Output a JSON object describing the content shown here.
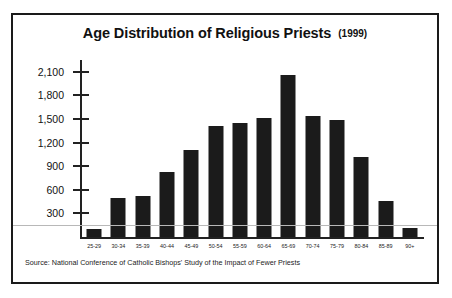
{
  "figure": {
    "title_main": "Age Distribution of Religious Priests",
    "title_year": "(1999)",
    "source": "Source: National Conference of Catholic Bishops' Study of the Impact of Fewer Priests",
    "frame_color": "#1a1a1a",
    "bar_color": "#1b1b1b",
    "background": "#ffffff"
  },
  "chart_data": {
    "type": "bar",
    "xlabel": "",
    "ylabel": "",
    "categories": [
      "25-29",
      "30-34",
      "35-39",
      "40-44",
      "45-49",
      "50-54",
      "55-59",
      "60-64",
      "65-69",
      "70-74",
      "75-79",
      "80-84",
      "85-89",
      "90+"
    ],
    "values": [
      100,
      500,
      520,
      830,
      1105,
      1410,
      1455,
      1510,
      2055,
      1540,
      1485,
      1015,
      455,
      110
    ],
    "ylim": [
      0,
      2250
    ],
    "yticks": [
      300,
      600,
      900,
      1200,
      1500,
      1800,
      2100
    ],
    "ytick_labels": [
      "300",
      "600",
      "900",
      "1,200",
      "1,500",
      "1,800",
      "2,100"
    ],
    "grid": false,
    "legend": null,
    "annotations": [
      "Source: National Conference of Catholic Bishops' Study of the Impact of Fewer Priests"
    ]
  }
}
